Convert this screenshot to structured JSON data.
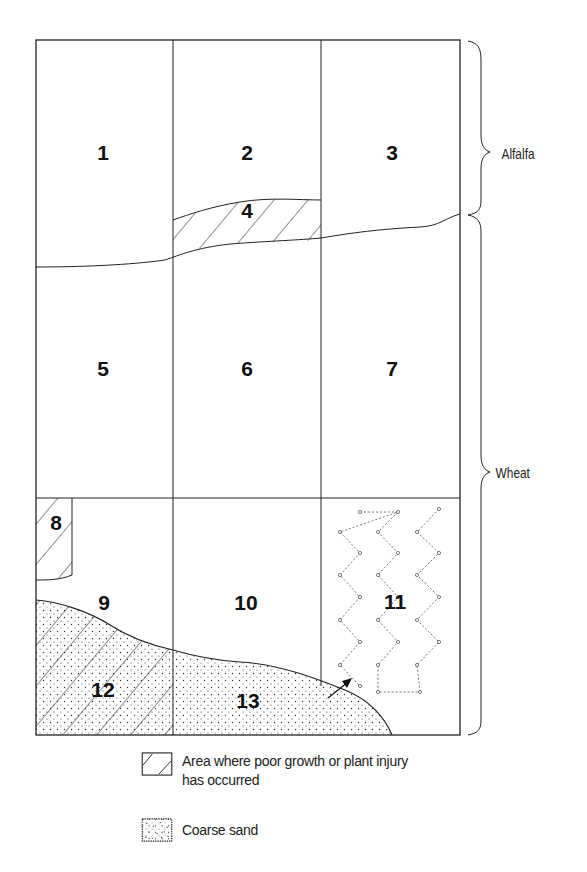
{
  "diagram": {
    "crop_labels": {
      "alfalfa": "Alfalfa",
      "wheat": "Wheat"
    },
    "regions": [
      {
        "id": "1",
        "label": "1",
        "crop": "Alfalfa",
        "pattern": "none"
      },
      {
        "id": "2",
        "label": "2",
        "crop": "Alfalfa",
        "pattern": "none"
      },
      {
        "id": "3",
        "label": "3",
        "crop": "Alfalfa",
        "pattern": "none"
      },
      {
        "id": "4",
        "label": "4",
        "crop": "Alfalfa",
        "pattern": "hatched"
      },
      {
        "id": "5",
        "label": "5",
        "crop": "Wheat",
        "pattern": "none"
      },
      {
        "id": "6",
        "label": "6",
        "crop": "Wheat",
        "pattern": "none"
      },
      {
        "id": "7",
        "label": "7",
        "crop": "Wheat",
        "pattern": "none"
      },
      {
        "id": "8",
        "label": "8",
        "crop": "Wheat",
        "pattern": "hatched"
      },
      {
        "id": "9",
        "label": "9",
        "crop": "Wheat",
        "pattern": "none"
      },
      {
        "id": "10",
        "label": "10",
        "crop": "Wheat",
        "pattern": "none"
      },
      {
        "id": "11",
        "label": "11",
        "crop": "Wheat",
        "pattern": "zigzag-dotted"
      },
      {
        "id": "12",
        "label": "12",
        "crop": "Wheat",
        "pattern": "hatched-and-dotted"
      },
      {
        "id": "13",
        "label": "13",
        "crop": "Wheat",
        "pattern": "dotted"
      }
    ],
    "legend": [
      {
        "key": "hatched",
        "text": "Area where poor growth or plant injury has occurred"
      },
      {
        "key": "dotted",
        "text": "Coarse sand"
      }
    ],
    "colors": {
      "ink": "#222222",
      "background": "#ffffff"
    }
  }
}
